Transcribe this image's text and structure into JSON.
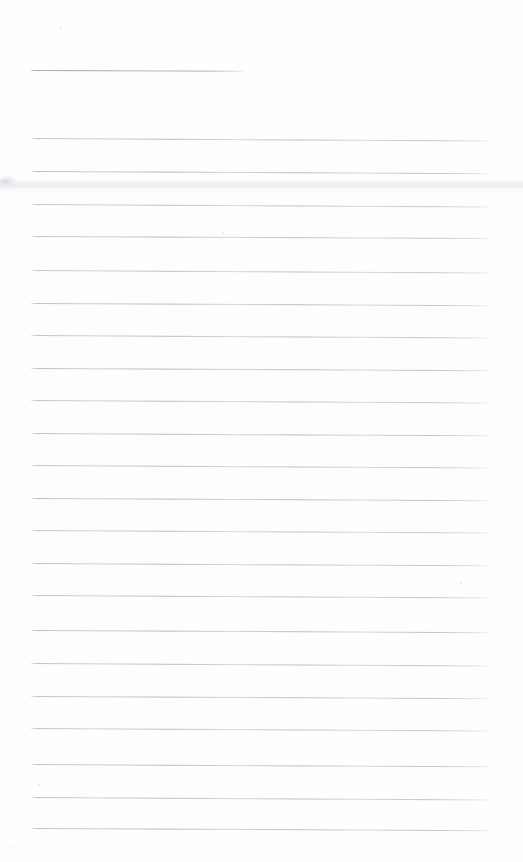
{
  "document": {
    "kind": "scanned-blank-lined-notepad-page",
    "title": "",
    "body_text": "",
    "written_content": "",
    "page_width": 523,
    "page_height": 862,
    "background_color": "#fefefe",
    "rule_color": "#b0b4bc",
    "rule_thickness_px": 1,
    "rule_left_x": 30,
    "rule_right_x": 492,
    "rule_spacing_px": 32.4,
    "total_rule_count": 24,
    "is_blank": "true"
  },
  "header_rule": {
    "label": "title-line",
    "x": 30,
    "y": 70,
    "width": 215,
    "tilt_deg": 0.22
  },
  "rules": [
    {
      "y": 138,
      "x": 30,
      "width": 462,
      "tilt_deg": 0.3,
      "opacity": 0.92
    },
    {
      "y": 171,
      "x": 30,
      "width": 462,
      "tilt_deg": 0.28,
      "opacity": 0.95
    },
    {
      "y": 204,
      "x": 30,
      "width": 462,
      "tilt_deg": 0.3,
      "opacity": 0.88
    },
    {
      "y": 236,
      "x": 30,
      "width": 462,
      "tilt_deg": 0.26,
      "opacity": 0.9
    },
    {
      "y": 270,
      "x": 30,
      "width": 462,
      "tilt_deg": 0.3,
      "opacity": 0.86
    },
    {
      "y": 303,
      "x": 30,
      "width": 462,
      "tilt_deg": 0.28,
      "opacity": 0.93
    },
    {
      "y": 335,
      "x": 30,
      "width": 462,
      "tilt_deg": 0.3,
      "opacity": 0.89
    },
    {
      "y": 368,
      "x": 30,
      "width": 462,
      "tilt_deg": 0.27,
      "opacity": 0.94
    },
    {
      "y": 400,
      "x": 30,
      "width": 462,
      "tilt_deg": 0.3,
      "opacity": 0.87
    },
    {
      "y": 433,
      "x": 30,
      "width": 462,
      "tilt_deg": 0.29,
      "opacity": 0.92
    },
    {
      "y": 465,
      "x": 30,
      "width": 462,
      "tilt_deg": 0.3,
      "opacity": 0.88
    },
    {
      "y": 498,
      "x": 30,
      "width": 462,
      "tilt_deg": 0.27,
      "opacity": 0.93
    },
    {
      "y": 530,
      "x": 30,
      "width": 462,
      "tilt_deg": 0.3,
      "opacity": 0.86
    },
    {
      "y": 563,
      "x": 30,
      "width": 462,
      "tilt_deg": 0.29,
      "opacity": 0.91
    },
    {
      "y": 595,
      "x": 30,
      "width": 462,
      "tilt_deg": 0.3,
      "opacity": 0.88
    },
    {
      "y": 630,
      "x": 30,
      "width": 462,
      "tilt_deg": 0.28,
      "opacity": 0.94
    },
    {
      "y": 663,
      "x": 30,
      "width": 462,
      "tilt_deg": 0.3,
      "opacity": 0.9
    },
    {
      "y": 696,
      "x": 30,
      "width": 462,
      "tilt_deg": 0.27,
      "opacity": 0.92
    },
    {
      "y": 728,
      "x": 30,
      "width": 462,
      "tilt_deg": 0.3,
      "opacity": 0.87
    },
    {
      "y": 764,
      "x": 30,
      "width": 462,
      "tilt_deg": 0.29,
      "opacity": 0.93
    },
    {
      "y": 797,
      "x": 30,
      "width": 462,
      "tilt_deg": 0.3,
      "opacity": 0.9
    },
    {
      "y": 828,
      "x": 30,
      "width": 462,
      "tilt_deg": 0.28,
      "opacity": 0.94
    }
  ],
  "artifacts": {
    "scan_smudge_band": {
      "y": 179,
      "height": 13
    },
    "edge_speck": {
      "x": 0,
      "y": 176,
      "width": 17,
      "height": 11
    },
    "dust_specks": [
      {
        "x": 60,
        "y": 27,
        "size": 2
      },
      {
        "x": 222,
        "y": 232,
        "size": 2
      },
      {
        "x": 18,
        "y": 455,
        "size": 2
      },
      {
        "x": 460,
        "y": 582,
        "size": 2
      },
      {
        "x": 38,
        "y": 784,
        "size": 2
      },
      {
        "x": 12,
        "y": 847,
        "size": 2
      }
    ]
  }
}
